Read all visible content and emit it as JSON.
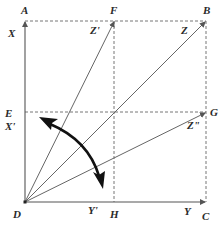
{
  "diagram": {
    "type": "vector-decomposition",
    "points": {
      "A": {
        "label": "A",
        "x": 25,
        "y": 21
      },
      "B": {
        "label": "B",
        "x": 206,
        "y": 21
      },
      "C": {
        "label": "C",
        "x": 206,
        "y": 202
      },
      "D": {
        "label": "D",
        "x": 25,
        "y": 202
      },
      "E": {
        "label": "E",
        "x": 25,
        "y": 112
      },
      "F": {
        "label": "F",
        "x": 114,
        "y": 21
      },
      "G": {
        "label": "G",
        "x": 206,
        "y": 112
      },
      "H": {
        "label": "H",
        "x": 114,
        "y": 202
      }
    },
    "vector_labels": {
      "X": "X",
      "X_prime": "X'",
      "Y": "Y",
      "Y_prime": "Y'",
      "Z": "Z",
      "Z_prime": "Z'",
      "Z_double_prime": "Z\""
    },
    "solid_lines": [
      "D-A",
      "D-C",
      "D-F",
      "D-B",
      "D-G"
    ],
    "dashed_lines": [
      "A-B",
      "B-C",
      "E-G",
      "F-H"
    ],
    "rotation_arrow": "double-headed curved arrow between D-F and D-G",
    "colors": {
      "line": "#555555",
      "dashed": "#777777",
      "arrow": "#111111",
      "text": "#2a2a2a"
    }
  }
}
